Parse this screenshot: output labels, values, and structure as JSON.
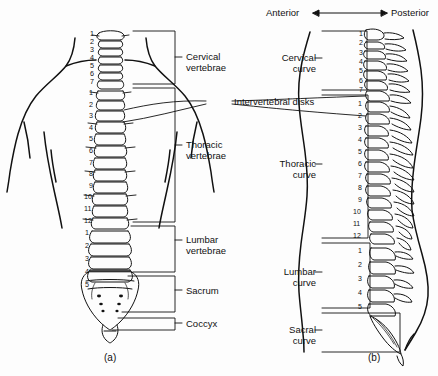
{
  "figure": {
    "background_color": "#fdfdfd",
    "ink_color": "#111111"
  },
  "orientation": {
    "anterior_label": "Anterior",
    "posterior_label": "Posterior",
    "arrow": "double-headed"
  },
  "panel_a": {
    "id": "(a)",
    "view": "posterior",
    "labels": [
      {
        "key": "cervical",
        "text": "Cervical\nvertebrae"
      },
      {
        "key": "thoracic",
        "text": "Thoracic\nvertebrae"
      },
      {
        "key": "lumbar",
        "text": "Lumbar\nvertebrae"
      },
      {
        "key": "sacrum",
        "text": "Sacrum"
      },
      {
        "key": "coccyx",
        "text": "Coccyx"
      }
    ],
    "vertebra_numbers": {
      "cervical": [
        "1",
        "2",
        "3",
        "4",
        "5",
        "6",
        "7"
      ],
      "thoracic": [
        "1",
        "2",
        "3",
        "4",
        "5",
        "6",
        "7",
        "8",
        "9",
        "10",
        "11",
        "12"
      ],
      "lumbar": [
        "1",
        "2",
        "3",
        "4",
        "5"
      ]
    }
  },
  "panel_b": {
    "id": "(b)",
    "view": "lateral",
    "labels": [
      {
        "key": "cervical_curve",
        "text": "Cervical\ncurve"
      },
      {
        "key": "thoracic_curve",
        "text": "Thoracic\ncurve"
      },
      {
        "key": "lumbar_curve",
        "text": "Lumbar\ncurve"
      },
      {
        "key": "sacral_curve",
        "text": "Sacral\ncurve"
      }
    ],
    "vertebra_numbers": {
      "cervical": [
        "1",
        "2",
        "3",
        "4",
        "5",
        "6",
        "7"
      ],
      "thoracic": [
        "1",
        "2",
        "3",
        "4",
        "5",
        "6",
        "7",
        "8",
        "9",
        "10",
        "11",
        "12"
      ],
      "lumbar": [
        "1",
        "2",
        "3",
        "4",
        "5"
      ]
    }
  },
  "shared_labels": [
    {
      "key": "disks",
      "text": "Intervertebral disks"
    }
  ]
}
